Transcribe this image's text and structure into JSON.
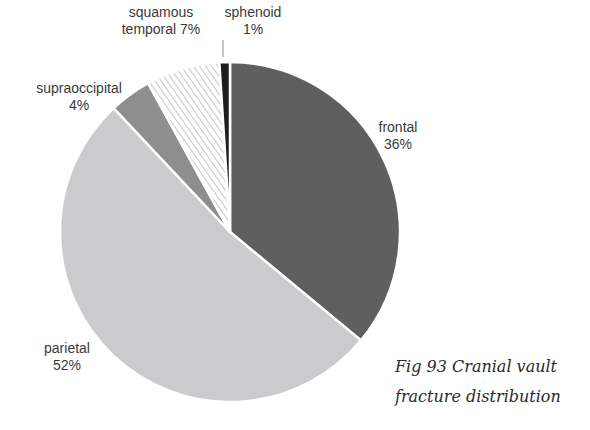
{
  "chart_data": {
    "type": "pie",
    "title": "Fig 93  Cranial vault fracture distribution",
    "start_angle_deg": 0,
    "direction": "clockwise",
    "legend": "none (direct labels)",
    "slices": [
      {
        "label": "frontal",
        "value": 36,
        "display": "36%",
        "fill": "#5f5f5f",
        "pattern": "solid"
      },
      {
        "label": "parietal",
        "value": 52,
        "display": "52%",
        "fill": "#c9cbcd",
        "pattern": "solid"
      },
      {
        "label": "supraoccipital",
        "value": 4,
        "display": "4%",
        "fill": "#8e8e8e",
        "pattern": "solid"
      },
      {
        "label": "squamous temporal",
        "value": 7,
        "display": "7%",
        "fill": "#ffffff",
        "pattern": "diagonal-hatch",
        "hatch_color": "#b8b8b8"
      },
      {
        "label": "sphenoid",
        "value": 1,
        "display": "1%",
        "fill": "#1e1e1e",
        "pattern": "solid"
      }
    ]
  },
  "labels": {
    "frontal": {
      "name": "frontal",
      "pct": "36%"
    },
    "parietal": {
      "name": "parietal",
      "pct": "52%"
    },
    "supraoccipital": {
      "name": "supraoccipital",
      "pct": "4%"
    },
    "squamous": {
      "name": "squamous",
      "name2": "temporal 7%"
    },
    "sphenoid": {
      "name": "sphenoid",
      "pct": "1%"
    }
  },
  "caption": {
    "line1": "Fig 93  Cranial vault",
    "line2": "fracture distribution"
  }
}
